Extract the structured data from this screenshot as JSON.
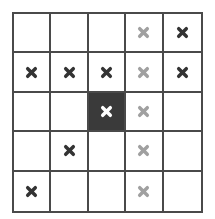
{
  "grid": {
    "rows": 5,
    "cols": 5,
    "colors": {
      "line": "#4a4a4a",
      "dark_mark": "#333333",
      "gray_mark": "#a0a0a0",
      "filled_cell": "#3a3a3a",
      "white_mark": "#ffffff"
    },
    "cells": [
      [
        "empty",
        "empty",
        "empty",
        "gray-x",
        "dark-x"
      ],
      [
        "dark-x",
        "dark-x",
        "dark-x",
        "gray-x",
        "dark-x"
      ],
      [
        "empty",
        "empty",
        "filled-white-x",
        "gray-x",
        "empty"
      ],
      [
        "empty",
        "dark-x",
        "empty",
        "gray-x",
        "empty"
      ],
      [
        "dark-x",
        "empty",
        "empty",
        "gray-x",
        "empty"
      ]
    ]
  }
}
